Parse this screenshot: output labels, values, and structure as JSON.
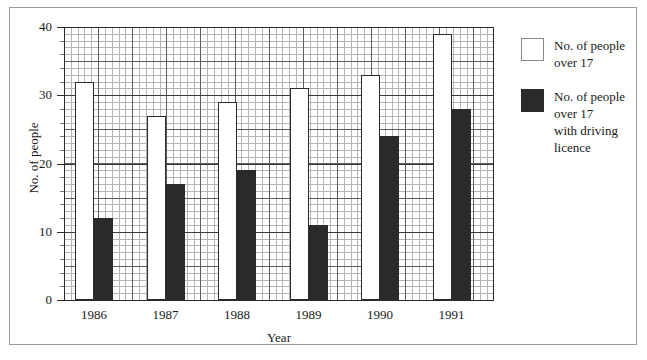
{
  "chart_data": {
    "type": "bar",
    "title": "",
    "xlabel": "Year",
    "ylabel": "No. of people",
    "categories": [
      "1986",
      "1987",
      "1988",
      "1989",
      "1990",
      "1991"
    ],
    "ylim": [
      0,
      40
    ],
    "yticks": [
      0,
      10,
      20,
      30,
      40
    ],
    "ytick_labels": [
      "0",
      "10",
      "20",
      "30",
      "40"
    ],
    "grid": true,
    "legend_position": "right",
    "series": [
      {
        "name": "No. of people\nover 17",
        "color": "#ffffff",
        "values": [
          32,
          27,
          29,
          31,
          33,
          39
        ]
      },
      {
        "name": "No. of people\nover 17\nwith driving\nlicence",
        "color": "#2a2a2a",
        "values": [
          12,
          17,
          19,
          11,
          24,
          28
        ]
      }
    ]
  },
  "legend": {
    "items": [
      {
        "label": "No. of people\nover 17",
        "swatch": "light"
      },
      {
        "label": "No. of people\nover 17\nwith driving\nlicence",
        "swatch": "dark"
      }
    ]
  },
  "axes": {
    "y_title": "No. of people",
    "x_title": "Year",
    "y_labels": [
      "40",
      "30",
      "20",
      "10",
      "0"
    ],
    "x_labels": [
      "1986",
      "1987",
      "1988",
      "1989",
      "1990",
      "1991"
    ]
  },
  "colors": {
    "series_light": "#ffffff",
    "series_dark": "#2a2a2a",
    "axis": "#2b2b2b",
    "grid_fine": "#b5b5b5",
    "grid_coarse": "#5d5d5d",
    "frame": "#9a9a9a"
  }
}
